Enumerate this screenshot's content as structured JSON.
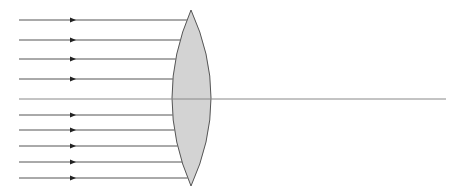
{
  "diagram": {
    "title": "",
    "colors": {
      "lens_fill": "#d3d3d3",
      "lens_stroke": "#555555",
      "ray": "#555555",
      "axis": "#888888",
      "arrow": "#222222"
    },
    "lens": {
      "type": "biconvex",
      "top": [
        191,
        10
      ],
      "bottom": [
        191,
        186
      ],
      "left_extreme_x": 172,
      "right_extreme_x": 211
    },
    "principal_axis": {
      "y": 99,
      "x_start": 19,
      "x_end": 446
    },
    "rays": {
      "x_start": 19,
      "arrow_x": 73,
      "y_positions": [
        20,
        40,
        59,
        79,
        115,
        130,
        146,
        162,
        178
      ]
    }
  }
}
